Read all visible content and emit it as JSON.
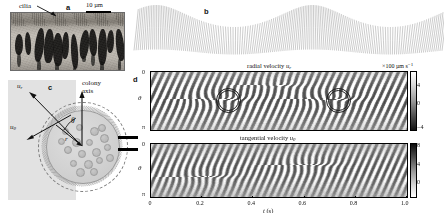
{
  "figure": {
    "caption_panels": [
      "a",
      "b",
      "c",
      "d"
    ]
  },
  "panel_a": {
    "letter": "a",
    "cilia_label": "cilia",
    "scalebar_label": "10 µm",
    "arrow_icon": "arrow-pointing-down-right"
  },
  "panel_b": {
    "letter": "b"
  },
  "panel_c": {
    "letter": "c",
    "axis_label_line1": "colony",
    "axis_label_line2": "axis",
    "theta_label": "θ",
    "r_label": "r",
    "u_r_label": "u",
    "u_r_sub": "r",
    "u_theta_label": "u",
    "u_theta_sub": "θ"
  },
  "panel_d": {
    "letter": "d",
    "top_title_prefix": "radial velocity ",
    "top_title_sym": "u",
    "top_title_sub": "r",
    "bottom_title_prefix": "tangential velocity ",
    "bottom_title_sym": "u",
    "bottom_title_sub": "θ",
    "colorbar_units_prefix": "×100 µm s",
    "colorbar_units_sup": "−1",
    "y_axis_label": "θ",
    "y_ticks": [
      "0",
      "π"
    ],
    "x_axis_label_prefix": "t",
    "x_axis_label_unit": " (s)",
    "x_ticks": [
      "0",
      "0.2",
      "0.4",
      "0.6",
      "0.8",
      "1.0"
    ],
    "colorbar_ticks_radial": [
      "4",
      "0",
      "−4"
    ],
    "colorbar_ticks_tangential": [
      "8",
      "4",
      "0"
    ],
    "annotation_circles": 2
  },
  "chart_data": {
    "type": "heatmap",
    "panels": [
      {
        "name": "radial velocity",
        "symbol": "u_r",
        "xlabel": "t (s)",
        "ylabel": "θ",
        "xlim": [
          0.0,
          1.0
        ],
        "ylim": [
          0,
          3.14159
        ],
        "x_ticks": [
          0,
          0.2,
          0.4,
          0.6,
          0.8,
          1.0
        ],
        "y_ticks": [
          0,
          3.14159
        ],
        "y_tick_labels": [
          "0",
          "π"
        ],
        "colorbar_units": "×100 µm s−1",
        "colorbar_ticks": [
          4,
          0,
          -4
        ],
        "clim": [
          -4,
          5
        ],
        "colormap": "gray",
        "annotations": [
          {
            "type": "circle",
            "x": 0.27,
            "y": 1.45,
            "radius_t": 0.055,
            "note": "wave defect"
          },
          {
            "type": "circle",
            "x": 0.7,
            "y": 1.45,
            "radius_t": 0.055,
            "note": "wave defect"
          }
        ]
      },
      {
        "name": "tangential velocity",
        "symbol": "u_theta",
        "xlabel": "t (s)",
        "ylabel": "θ",
        "xlim": [
          0.0,
          1.0
        ],
        "ylim": [
          0,
          3.14159
        ],
        "x_ticks": [
          0,
          0.2,
          0.4,
          0.6,
          0.8,
          1.0
        ],
        "y_ticks": [
          0,
          3.14159
        ],
        "y_tick_labels": [
          "0",
          "π"
        ],
        "colorbar_units": "×100 µm s−1",
        "colorbar_ticks": [
          8,
          4,
          0
        ],
        "clim": [
          0,
          8
        ],
        "colormap": "gray",
        "annotations": []
      }
    ],
    "grid": false,
    "legend": "colorbar-right"
  },
  "colors": {
    "background": "#ffffff",
    "text": "#111111",
    "panel_c_backplate": "#e2e2e2",
    "colony_fill": "#d2d2d2",
    "kymo_mid": "#bdbdbd",
    "annotation_stroke": "#1a1a1a"
  }
}
